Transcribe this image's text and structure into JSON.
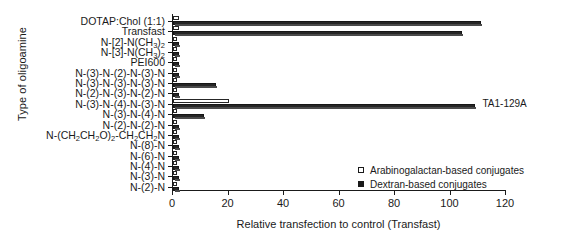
{
  "chart_data": {
    "type": "bar",
    "orientation": "horizontal",
    "title": "",
    "xlabel": "Relative transfection to control (Transfast)",
    "ylabel": "Type of oligoamine",
    "xlim": [
      0,
      120
    ],
    "xticks": [
      0,
      20,
      40,
      60,
      80,
      100,
      120
    ],
    "grid": false,
    "legend_position": "lower-right",
    "series": [
      {
        "name": "Arabinogalactan-based conjugates",
        "color": "#ffffff",
        "values": [
          2.0,
          2.0,
          1.5,
          1.5,
          1.5,
          1.5,
          1.5,
          1.5,
          20.0,
          1.5,
          1.5,
          1.5,
          1.5,
          1.5,
          1.5,
          1.5,
          1.5
        ]
      },
      {
        "name": "Dextran-based conjugates",
        "color": "#262626",
        "values": [
          111.0,
          104.0,
          2.0,
          2.0,
          2.0,
          2.0,
          15.5,
          2.0,
          109.0,
          11.0,
          2.0,
          2.0,
          2.0,
          2.0,
          2.0,
          2.0,
          2.0
        ]
      }
    ],
    "categories": [
      "DOTAP:Chol (1:1)",
      "Transfast",
      "N-[2]-N(CH3)2",
      "N-[3]-N(CH3)2",
      "PEI600",
      "N-(3)-N-(2)-N-(3)-N",
      "N-(3)-N-(3)-N-(3)-N",
      "N-(2)-N-(3)-N-(2)-N",
      "N-(3)-N-(4)-N-(3)-N",
      "N-(3)-N-(4)-N",
      "N-(2)-N-(2)-N",
      "N-(CH2CH2O)2-CH2CH2N",
      "N-(8)-N",
      "N-(6)-N",
      "N-(4)-N",
      "N-(3)-N",
      "N-(2)-N"
    ],
    "annotations": [
      {
        "text": "TA1-129A",
        "category": "N-(3)-N-(4)-N-(3)-N",
        "value": 109.0
      }
    ]
  },
  "legend": {
    "items": [
      {
        "label": "Arabinogalactan-based conjugates",
        "swatch": "open-square-icon"
      },
      {
        "label": "Dextran-based conjugates",
        "swatch": "filled-square-icon"
      }
    ]
  },
  "axis": {
    "x_title": "Relative transfection to control (Transfast)",
    "y_title": "Type of oligoamine",
    "x_tick_labels": [
      "0",
      "20",
      "40",
      "60",
      "80",
      "100",
      "120"
    ]
  }
}
